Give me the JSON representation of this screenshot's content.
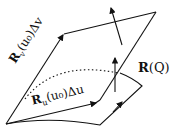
{
  "diagram": {
    "labels": {
      "rv": "R_v(u0)Δv",
      "ru": "R_u(u0)Δu",
      "rq": "R(Q)"
    },
    "parts": {
      "rv_bold": "R",
      "rv_sub": "v",
      "rv_rest": "(u₀)Δv",
      "ru_bold": "R",
      "ru_sub": "u",
      "ru_rest": "(u₀)Δu",
      "rq_bold": "R",
      "rq_rest": "(Q)"
    },
    "colors": {
      "stroke": "#111111",
      "background": "#ffffff"
    }
  }
}
